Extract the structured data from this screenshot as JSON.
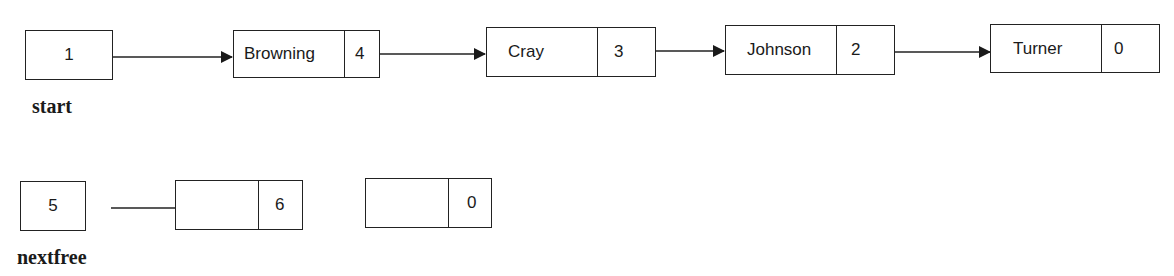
{
  "diagram": {
    "type": "linked-list",
    "lists": [
      {
        "name": "start",
        "label": "start",
        "head_value": "1",
        "nodes": [
          {
            "data": "Browning",
            "next": "4"
          },
          {
            "data": "Cray",
            "next": "3"
          },
          {
            "data": "Johnson",
            "next": "2"
          },
          {
            "data": "Turner",
            "next": "0"
          }
        ]
      },
      {
        "name": "nextfree",
        "label": "nextfree",
        "head_value": "5",
        "nodes": [
          {
            "data": "",
            "next": "6"
          },
          {
            "data": "",
            "next": "0"
          }
        ]
      }
    ],
    "colors": {
      "line": "#222222",
      "background": "#ffffff"
    }
  }
}
